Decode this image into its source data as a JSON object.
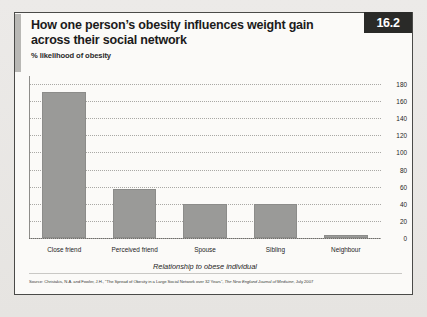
{
  "figure": {
    "badge": "16.2",
    "title": "How one person’s obesity influences weight gain across their social network",
    "subtitle": "% likelihood of obesity",
    "source_prefix": "Source: Christakis, N.A. and Fowler, J.H., “The Spread of Obesity in a Large Social Network over 32 Years”, ",
    "source_journal": "The New England Journal of Medicine",
    "source_suffix": ", July 2007"
  },
  "chart_data": {
    "type": "bar",
    "title": "How one person’s obesity influences weight gain across their social network",
    "subtitle": "% likelihood of obesity",
    "categories": [
      "Close friend",
      "Perceived friend",
      "Spouse",
      "Sibling",
      "Neighbour"
    ],
    "values": [
      171,
      57,
      40,
      40,
      3
    ],
    "xlabel": "Relationship to obese individual",
    "ylabel": "",
    "ylim": [
      0,
      180
    ],
    "ytick_step": 20,
    "yticks": [
      "0",
      "20",
      "40",
      "60",
      "80",
      "100",
      "120",
      "140",
      "160",
      "180"
    ],
    "grid": true,
    "legend": "none",
    "bar_color": "#9a9a98"
  }
}
